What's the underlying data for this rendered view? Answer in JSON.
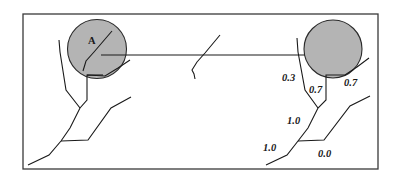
{
  "diagram": {
    "point_label": "A",
    "motion": "arrow from initial ball position to final ball position",
    "colors": {
      "ball_fill": "#b4b4b4",
      "stroke": "#1a1a1a",
      "frame": "#3a3a3a"
    },
    "weights": [
      {
        "id": "w1",
        "value": "0.3"
      },
      {
        "id": "w2",
        "value": "0.7"
      },
      {
        "id": "w3",
        "value": "0.7"
      },
      {
        "id": "w4",
        "value": "1.0"
      },
      {
        "id": "w5",
        "value": "1.0"
      },
      {
        "id": "w6",
        "value": "0.0"
      }
    ]
  }
}
